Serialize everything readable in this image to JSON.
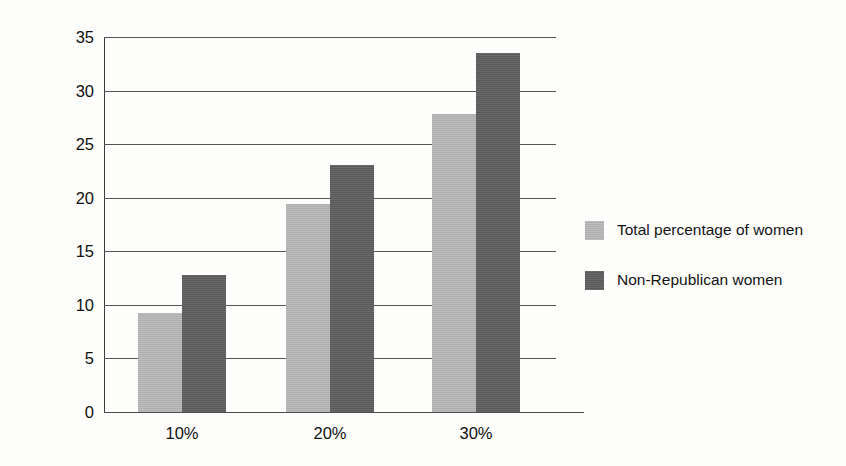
{
  "chart_data": {
    "type": "bar",
    "title": "",
    "xlabel": "",
    "ylabel": "Overall schedule control",
    "categories": [
      "10%",
      "20%",
      "30%"
    ],
    "series": [
      {
        "name": "Total percentage of women",
        "color": "#b4b4b4",
        "values": [
          9.2,
          19.4,
          27.8
        ]
      },
      {
        "name": "Non-Republican women",
        "color": "#5e5e5e",
        "values": [
          12.8,
          23.1,
          33.5
        ]
      }
    ],
    "ylim": [
      0,
      35
    ],
    "yticks": [
      0,
      5,
      10,
      15,
      20,
      25,
      30,
      35
    ],
    "ytick_labels": [
      "0",
      "5",
      "10",
      "15",
      "20",
      "25",
      "30",
      "35"
    ],
    "grid": true,
    "legend_position": "right"
  },
  "legend": {
    "items": [
      {
        "label": "Total percentage of women"
      },
      {
        "label": "Non-Republican women"
      }
    ]
  }
}
